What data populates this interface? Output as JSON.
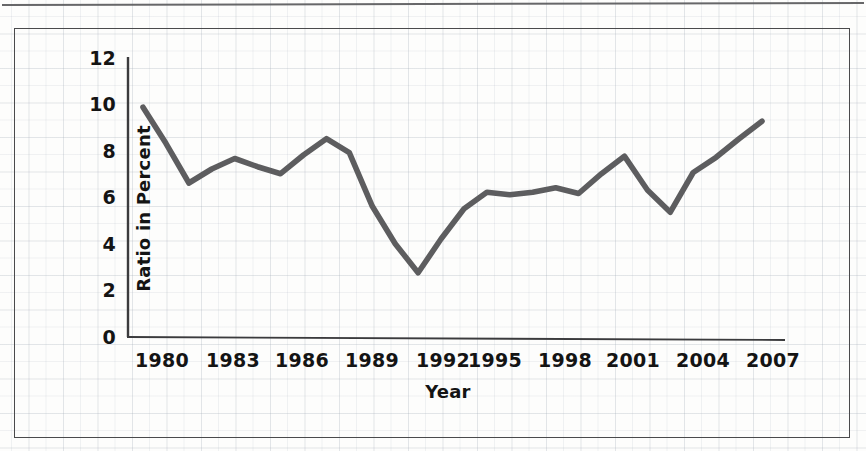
{
  "figure": {
    "kind": "scanned-line-chart",
    "line_color": "#5d5d5f",
    "axis_color": "#3b3b3d",
    "frame_color": "#4a4a4c",
    "grid_color": "#96a0af",
    "background_color": "#fdfdfc"
  },
  "chart_data": {
    "type": "line",
    "title": "",
    "xlabel": "Year",
    "ylabel": "Ratio in Percent",
    "xlim": [
      1980,
      2007
    ],
    "ylim": [
      0,
      12
    ],
    "ytick_values": [
      0,
      2,
      4,
      6,
      8,
      10,
      12
    ],
    "ytick_labels": [
      "0",
      "2",
      "4",
      "6",
      "8",
      "10",
      "12"
    ],
    "xtick_values": [
      1980,
      1983,
      1986,
      1989,
      1992,
      1995,
      1998,
      2001,
      2004,
      2007
    ],
    "xtick_labels": [
      "1980",
      "1983",
      "1986",
      "1989",
      "1992",
      "1995",
      "1998",
      "2001",
      "2004",
      "2007"
    ],
    "grid": true,
    "legend": false,
    "series": [
      {
        "name": "Ratio in Percent",
        "x": [
          1980,
          1981,
          1982,
          1983,
          1984,
          1985,
          1986,
          1987,
          1988,
          1989,
          1990,
          1991,
          1992,
          1993,
          1994,
          1995,
          1996,
          1997,
          1998,
          1999,
          2000,
          2001,
          2002,
          2003,
          2004,
          2005,
          2006
        ],
        "values": [
          9.85,
          8.3,
          6.6,
          7.2,
          7.65,
          7.3,
          7.0,
          7.8,
          8.5,
          7.9,
          5.6,
          4.0,
          2.75,
          4.2,
          5.5,
          6.2,
          6.1,
          6.2,
          6.4,
          6.15,
          7.0,
          7.75,
          6.3,
          5.35,
          7.05,
          7.7,
          8.5
        ]
      }
    ],
    "last_point": {
      "x": 2007,
      "value": 9.25
    }
  }
}
